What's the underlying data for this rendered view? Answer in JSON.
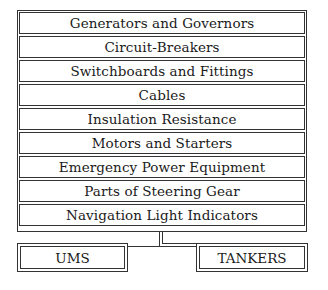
{
  "diagram": {
    "items": [
      {
        "label": "Generators and Governors"
      },
      {
        "label": "Circuit-Breakers"
      },
      {
        "label": "Switchboards and Fittings"
      },
      {
        "label": "Cables"
      },
      {
        "label": "Insulation Resistance"
      },
      {
        "label": "Motors and Starters"
      },
      {
        "label": "Emergency Power Equipment"
      },
      {
        "label": "Parts of Steering Gear"
      },
      {
        "label": "Navigation Light Indicators"
      }
    ],
    "branches": [
      {
        "label": "UMS"
      },
      {
        "label": "TANKERS"
      }
    ],
    "colors": {
      "line": "#333333",
      "background": "#ffffff",
      "text": "#1a1a1a"
    }
  }
}
